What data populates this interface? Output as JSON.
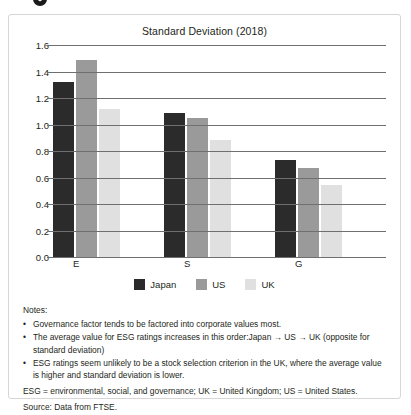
{
  "top_glyph": "●",
  "chart_data": {
    "type": "bar",
    "title": "Standard Deviation (2018)",
    "xlabel": "",
    "ylabel": "",
    "ylim": [
      0.0,
      1.6
    ],
    "ytick_step": 0.2,
    "grid": true,
    "legend_position": "bottom",
    "categories": [
      "E",
      "S",
      "G"
    ],
    "ytick_labels": [
      "0.0",
      "0.2",
      "0.4",
      "0.6",
      "0.8",
      "1.0",
      "1.2",
      "1.4",
      "1.6"
    ],
    "series": [
      {
        "name": "Japan",
        "color": "#2b2b2b",
        "values": [
          1.32,
          1.09,
          0.73
        ]
      },
      {
        "name": "US",
        "color": "#9a9a9a",
        "values": [
          1.49,
          1.05,
          0.67
        ]
      },
      {
        "name": "UK",
        "color": "#e0e0e0",
        "values": [
          1.12,
          0.88,
          0.54
        ]
      }
    ]
  },
  "notes": {
    "heading": "Notes:",
    "bullet_marker": "•",
    "bullets": [
      "Governance factor tends to be factored into corporate values most.",
      "The average value for ESG ratings increases in this order:Japan → US → UK (opposite for standard deviation)",
      "ESG ratings seem unlikely to be a stock selection criterion in the UK, where the average value is higher and standard deviation is lower."
    ],
    "abbreviations": "ESG = environmental, social, and governance; UK = United Kingdom; US = United States.",
    "source": "Source: Data from FTSE."
  }
}
